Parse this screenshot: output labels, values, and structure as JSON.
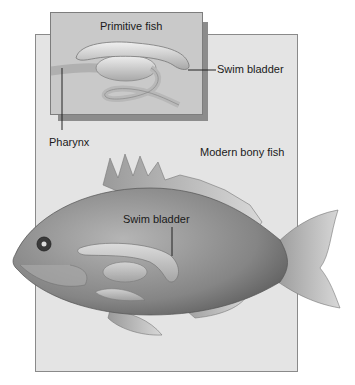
{
  "diagram": {
    "inset": {
      "title": "Primitive fish"
    },
    "main": {
      "title": "Modern bony fish"
    },
    "labels": {
      "swim_bladder_primitive": "Swim bladder",
      "pharynx": "Pharynx",
      "swim_bladder_modern": "Swim bladder"
    },
    "colors": {
      "panel_bg": "#e4e4e4",
      "inset_bg": "#c9c9c9",
      "inset_shadow": "#8c8c8c",
      "fish_body": "#8f8f8f",
      "organ": "#d4d4d4"
    }
  }
}
